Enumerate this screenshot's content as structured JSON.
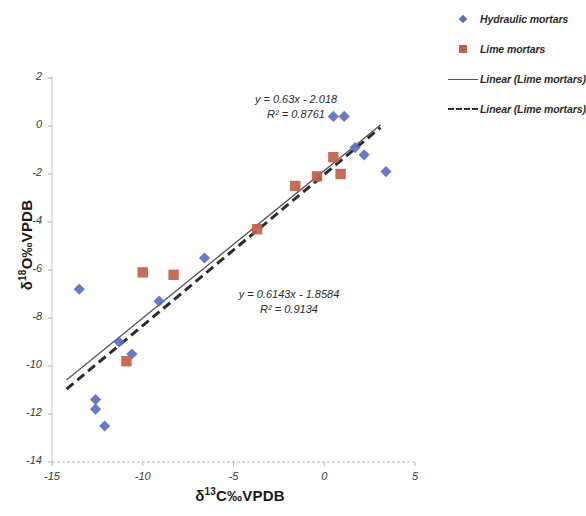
{
  "chart_data": {
    "type": "scatter",
    "title": "",
    "xlabel": "δ¹³C‰VPDB",
    "ylabel": "δ¹⁸O‰VPDB",
    "xlabel_parts": {
      "delta": "δ",
      "sup": "13",
      "rest": "C‰VPDB"
    },
    "ylabel_parts": {
      "delta": "δ",
      "sup": "18",
      "rest": "O‰VPDB"
    },
    "xlim": [
      -15,
      5
    ],
    "ylim": [
      -14,
      2
    ],
    "xticks": [
      -15,
      -10,
      -5,
      0,
      5
    ],
    "yticks": [
      2,
      0,
      -2,
      -4,
      -6,
      -8,
      -10,
      -12,
      -14
    ],
    "xtick_labels": [
      "-15",
      "-10",
      "-5",
      "0",
      "5"
    ],
    "ytick_labels": [
      "2",
      "0",
      "-2",
      "-4",
      "-6",
      "-8",
      "-10",
      "-12",
      "-14"
    ],
    "grid": false,
    "legend_position": "right",
    "series": [
      {
        "name": "Hydraulic mortars",
        "marker": "diamond",
        "color": "#5b6fc0",
        "points": [
          [
            -13.5,
            -6.8
          ],
          [
            -12.6,
            -11.4
          ],
          [
            -12.6,
            -11.8
          ],
          [
            -12.1,
            -12.5
          ],
          [
            -11.3,
            -9.0
          ],
          [
            -10.6,
            -9.5
          ],
          [
            -9.1,
            -7.3
          ],
          [
            -6.6,
            -5.5
          ],
          [
            0.5,
            0.4
          ],
          [
            1.1,
            0.4
          ],
          [
            1.7,
            -0.9
          ],
          [
            2.2,
            -1.2
          ],
          [
            3.4,
            -1.9
          ]
        ]
      },
      {
        "name": "Lime mortars",
        "marker": "square",
        "color": "#c0614a",
        "points": [
          [
            -10.9,
            -9.8
          ],
          [
            -10.0,
            -6.1
          ],
          [
            -8.3,
            -6.2
          ],
          [
            -3.7,
            -4.3
          ],
          [
            -1.6,
            -2.5
          ],
          [
            -0.4,
            -2.1
          ],
          [
            0.5,
            -1.3
          ],
          [
            0.9,
            -2.0
          ]
        ]
      }
    ],
    "trendlines": [
      {
        "name": "Linear (Lime mortars)",
        "style": "dashed",
        "color": "#2e2e2e",
        "slope": 0.63,
        "intercept": -2.018,
        "r2": 0.8761,
        "equation": "y = 0.63x - 2.018",
        "r2_text": "R² = 0.8761",
        "x_range": [
          -14.2,
          3.1
        ]
      },
      {
        "name": "Linear (Lime mortars)",
        "style": "solid",
        "color": "#555555",
        "slope": 0.6143,
        "intercept": -1.8584,
        "r2": 0.9134,
        "equation": "y = 0.6143x - 1.8584",
        "r2_text": "R² = 0.9134",
        "x_range": [
          -14.2,
          3.1
        ]
      }
    ]
  },
  "legend": {
    "items": [
      {
        "label": "Hydraulic mortars",
        "key": "diamond-marker"
      },
      {
        "label": "Lime mortars",
        "key": "square-marker"
      },
      {
        "label": "Linear (Lime mortars)",
        "key": "solid-line"
      },
      {
        "label": "Linear (Lime mortars)",
        "key": "dashed-line"
      }
    ]
  },
  "annotations": {
    "hydraulic_equation": "y = 0.63x - 2.018",
    "hydraulic_r2": "R² = 0.8761",
    "lime_equation": "y = 0.6143x - 1.8584",
    "lime_r2": "R² = 0.9134"
  }
}
